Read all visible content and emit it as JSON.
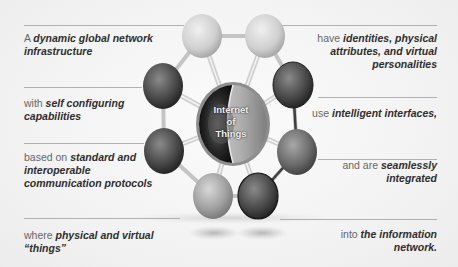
{
  "diagram": {
    "title": "Internet of Things",
    "center": {
      "label_lines": [
        "Internet",
        "of",
        "Things"
      ]
    },
    "left_items": [
      {
        "prefix": "A ",
        "emphasis_line1": "dynamic global network",
        "emphasis_line2": "infrastructure"
      },
      {
        "prefix": "with ",
        "emphasis_line1": "self configuring",
        "emphasis_line2": "capabilities"
      },
      {
        "prefix": "based on ",
        "emphasis_line1": "standard and",
        "emphasis_line2": "interoperable",
        "emphasis_line3": "communication protocols"
      },
      {
        "prefix": "where ",
        "emphasis_line1": "physical and virtual",
        "emphasis_line2": "“things”"
      }
    ],
    "right_items": [
      {
        "prefix": "have ",
        "emphasis_line1": "identities, physical",
        "emphasis_line2": "attributes, and virtual",
        "emphasis_line3": "personalities"
      },
      {
        "prefix": "use ",
        "emphasis_line1": "intelligent interfaces,"
      },
      {
        "prefix": "and are ",
        "emphasis_line1": "seamlessly",
        "emphasis_line2": "integrated"
      },
      {
        "prefix": "into ",
        "emphasis_line1": "the information",
        "emphasis_line2": "network."
      }
    ],
    "nodes": [
      {
        "position": "top-left",
        "shade": "#c9c9c9"
      },
      {
        "position": "top-right",
        "shade": "#d0d0d0"
      },
      {
        "position": "upper-left",
        "shade": "#4a4a4a"
      },
      {
        "position": "upper-right",
        "shade": "#3a3a3a"
      },
      {
        "position": "lower-left",
        "shade": "#555555"
      },
      {
        "position": "lower-right",
        "shade": "#6a6a6a"
      },
      {
        "position": "bottom-left",
        "shade": "#9c9c9c"
      },
      {
        "position": "bottom-right",
        "shade": "#3c3c3c"
      }
    ]
  }
}
